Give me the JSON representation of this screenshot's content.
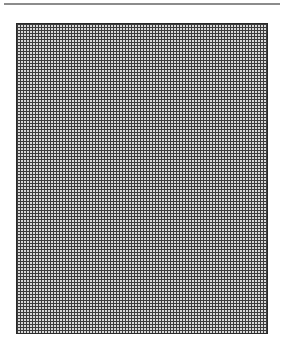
{
  "page": {
    "top_rule_color": "#8c8c8c",
    "grid": {
      "line_color": "#3c3c3c",
      "fill_color": "#d8d8d8",
      "border_color": "#2a2a2a",
      "cell_pitch_px": 3
    }
  }
}
